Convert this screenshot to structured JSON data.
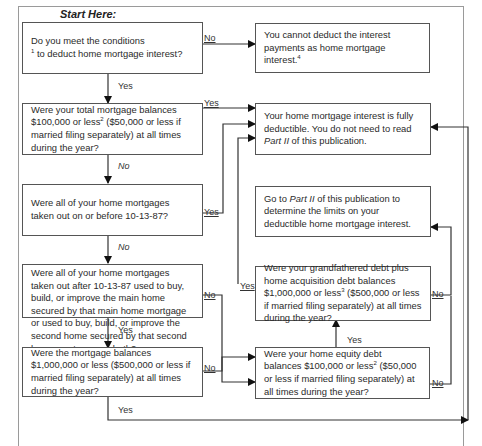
{
  "title": "Start Here:",
  "boxes": {
    "q1": {
      "text_a": "Do you meet the conditions",
      "sup": "1",
      "text_b": " to deduct home mortgage interest?"
    },
    "r_cannot": {
      "text_a": "You cannot deduct the interest payments as home mortgage interest.",
      "sup": "4"
    },
    "q2": {
      "text_a": "Were your total mortgage balances $100,000 or less",
      "sup": "2",
      "text_b": " ($50,000 or less if married filing separately) at all times during the year?"
    },
    "r_full": {
      "text_a": "Your home mortgage interest is fully deductible. You do not need to read ",
      "em": "Part II",
      "text_b": " of this publication."
    },
    "q3": {
      "text_a": "Were all of your home mortgages taken out on or before 10-13-87?"
    },
    "r_part2": {
      "text_a": "Go to ",
      "em": "Part II",
      "text_b": " of this publication to determine the limits on your deductible home mortgage interest."
    },
    "q4": {
      "text_a": "Were all of your home mortgages taken out after 10-13-87 used to buy, build, or improve the main home secured by that main home mortgage or used to buy, build, or improve the second home secured by that second home mortgage, or both?"
    },
    "q5": {
      "text_a": "Were your grandfathered debt plus home acquisition debt balances $1,000,000 or less",
      "sup": "3",
      "text_b": " ($500,000 or less if married filing separately) at all times during the year?"
    },
    "q6": {
      "text_a": "Were the mortgage balances $1,000,000 or less ($500,000 or less if married filing separately) at all times during the year?"
    },
    "q7": {
      "text_a": "Were your home equity debt balances $100,000 or less",
      "sup": "2",
      "text_b": " ($50,000 or less if married filing separately) at all times during the year?"
    }
  },
  "labels": {
    "q1_no": "No",
    "q1_yes": "Yes",
    "q2_yes": "Yes",
    "q2_no": "No",
    "q3_yes": "Yes",
    "q3_no": "No",
    "q4_no": "No",
    "q4_yes": "Yes",
    "q5_yes_in": "Yes",
    "q5_no": "No",
    "q6_no": "No",
    "q6_yes": "Yes",
    "q7_yes": "Yes",
    "q7_no": "No"
  }
}
